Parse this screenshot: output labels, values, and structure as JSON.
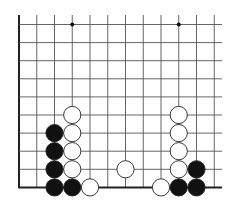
{
  "diagram": {
    "type": "go-board-fragment",
    "grid": {
      "columns": 12,
      "rows": 10,
      "origin_x": 19,
      "origin_y": 24.5,
      "spacing_x": 17.75,
      "spacing_y": 18.1,
      "left_edge": true,
      "bottom_edge": true,
      "line_color": "#555555",
      "edge_color": "#222222"
    },
    "hoshi": [
      {
        "col": 3,
        "row": 0
      },
      {
        "col": 9,
        "row": 0
      }
    ],
    "stones": [
      {
        "color": "white",
        "col": 3,
        "row": 5
      },
      {
        "color": "white",
        "col": 3,
        "row": 6
      },
      {
        "color": "white",
        "col": 3,
        "row": 7
      },
      {
        "color": "white",
        "col": 3,
        "row": 8
      },
      {
        "color": "black",
        "col": 2,
        "row": 6
      },
      {
        "color": "black",
        "col": 2,
        "row": 7
      },
      {
        "color": "black",
        "col": 2,
        "row": 8
      },
      {
        "color": "black",
        "col": 2,
        "row": 9
      },
      {
        "color": "black",
        "col": 3,
        "row": 9
      },
      {
        "color": "white",
        "col": 4,
        "row": 9
      },
      {
        "color": "white",
        "col": 6,
        "row": 8
      },
      {
        "color": "white",
        "col": 9,
        "row": 5
      },
      {
        "color": "white",
        "col": 9,
        "row": 6
      },
      {
        "color": "white",
        "col": 9,
        "row": 7
      },
      {
        "color": "white",
        "col": 9,
        "row": 8
      },
      {
        "color": "white",
        "col": 8,
        "row": 9
      },
      {
        "color": "black",
        "col": 9,
        "row": 9
      },
      {
        "color": "black",
        "col": 10,
        "row": 8
      },
      {
        "color": "black",
        "col": 10,
        "row": 9
      }
    ]
  }
}
